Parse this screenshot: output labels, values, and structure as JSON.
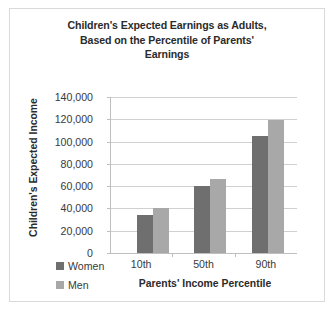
{
  "chart_data": {
    "type": "bar",
    "title": "Children's Expected Earnings as Adults, Based on the Percentile of Parents' Earnings",
    "title_lines": [
      "Children's Expected Earnings as Adults,",
      "Based on the Percentile of Parents'",
      "Earnings"
    ],
    "xlabel": "Parents' Income Percentile",
    "ylabel": "Children's Expected Income",
    "categories": [
      "10th",
      "50th",
      "90th"
    ],
    "series": [
      {
        "name": "Women",
        "color": "#6f6f6f",
        "values": [
          34000,
          60500,
          105000
        ]
      },
      {
        "name": "Men",
        "color": "#a8a8a8",
        "values": [
          40000,
          66000,
          119000
        ]
      }
    ],
    "ylim": [
      0,
      140000
    ],
    "ytick_values": [
      0,
      20000,
      40000,
      60000,
      80000,
      100000,
      120000,
      140000
    ],
    "ytick_labels": [
      "0",
      "20,000",
      "40,000",
      "60,000",
      "80,000",
      "100,000",
      "120,000",
      "140,000"
    ],
    "grid": true,
    "legend_position": "bottom-left",
    "legend": [
      {
        "label": "Women",
        "color": "#6f6f6f"
      },
      {
        "label": "Men",
        "color": "#a8a8a8"
      }
    ]
  },
  "style": {
    "border_color": "#d9d9d9",
    "gridline_color": "#d0d0d0",
    "axis_color": "#bfbfbf",
    "text_color": "#2b2b2b",
    "background": "#ffffff"
  }
}
